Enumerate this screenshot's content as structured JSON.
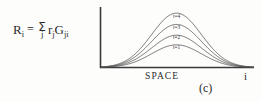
{
  "figure": {
    "panel_label": "(c)",
    "background_color": "#fdfdfc",
    "ink_color": "#2b2b2b"
  },
  "equation": {
    "lhs_var": "R",
    "lhs_sub": "i",
    "equals": "=",
    "sigma": "Σ",
    "sigma_index": "j",
    "term1_var": "r",
    "term1_sub": "j",
    "term2_var": "G",
    "term2_sub": "ji",
    "plain_text": "R_i = Σ_j r_j G_ji"
  },
  "chart_data": {
    "type": "line",
    "title": "",
    "subtitle": "",
    "xlabel": "SPACE",
    "ylabel": "",
    "x_axis_end_label": "i",
    "grid": false,
    "legend_position": "inline-on-curves",
    "axis_style": "left-and-bottom-spines",
    "xlim": [
      0,
      160
    ],
    "ylim": [
      0,
      1.05
    ],
    "curve_shape": "gaussian",
    "peak_x": 79,
    "sigma_width": 26,
    "series": [
      {
        "name": "t=1",
        "label": "t=1",
        "peak_height": 0.4,
        "label_x": 79,
        "label_y": 0.33
      },
      {
        "name": "t=2",
        "label": "t=2",
        "peak_height": 0.57,
        "label_x": 79,
        "label_y": 0.5
      },
      {
        "name": "t=3",
        "label": "t=3",
        "peak_height": 0.76,
        "label_x": 79,
        "label_y": 0.68
      },
      {
        "name": "t=4",
        "label": "t=4",
        "peak_height": 0.96,
        "label_x": 79,
        "label_y": 0.88
      }
    ]
  }
}
